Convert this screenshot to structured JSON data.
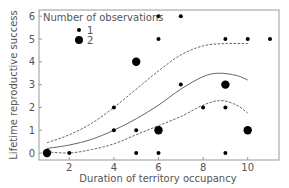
{
  "chart_data": {
    "type": "scatter",
    "title": "",
    "xlabel": "Duration of territory occupancy",
    "ylabel": "Lifetime reproductive success",
    "xlim": [
      0.6,
      11.4
    ],
    "ylim": [
      -0.3,
      6.3
    ],
    "xticks": [
      2,
      4,
      6,
      8,
      10
    ],
    "yticks": [
      0,
      1,
      2,
      3,
      4,
      5,
      6
    ],
    "grid": false,
    "legend": {
      "title": "Number of observations",
      "position": "upper left",
      "entries": [
        {
          "label": "1",
          "size": "small"
        },
        {
          "label": "2",
          "size": "large"
        }
      ]
    },
    "points": [
      {
        "x": 1,
        "y": 0,
        "n": 2
      },
      {
        "x": 2,
        "y": 0,
        "n": 1
      },
      {
        "x": 4,
        "y": 2,
        "n": 1
      },
      {
        "x": 4,
        "y": 1,
        "n": 1
      },
      {
        "x": 5,
        "y": 4,
        "n": 2
      },
      {
        "x": 5,
        "y": 1,
        "n": 1
      },
      {
        "x": 5,
        "y": 0,
        "n": 1
      },
      {
        "x": 6,
        "y": 6,
        "n": 1
      },
      {
        "x": 6,
        "y": 5,
        "n": 1
      },
      {
        "x": 6,
        "y": 1,
        "n": 2
      },
      {
        "x": 6,
        "y": 0,
        "n": 1
      },
      {
        "x": 7,
        "y": 6,
        "n": 1
      },
      {
        "x": 7,
        "y": 3,
        "n": 1
      },
      {
        "x": 8,
        "y": 2,
        "n": 1
      },
      {
        "x": 9,
        "y": 5,
        "n": 1
      },
      {
        "x": 9,
        "y": 3,
        "n": 2
      },
      {
        "x": 9,
        "y": 2,
        "n": 1
      },
      {
        "x": 9,
        "y": 0,
        "n": 1
      },
      {
        "x": 10,
        "y": 5,
        "n": 1
      },
      {
        "x": 10,
        "y": 1,
        "n": 2
      },
      {
        "x": 11,
        "y": 5,
        "n": 1
      }
    ],
    "series": [
      {
        "name": "fitted",
        "style": "solid",
        "x": [
          1,
          2,
          3,
          4,
          5,
          6,
          7,
          8,
          8.7,
          9.5,
          10
        ],
        "y": [
          0.2,
          0.35,
          0.6,
          1.0,
          1.5,
          2.1,
          2.8,
          3.35,
          3.5,
          3.4,
          3.2
        ]
      },
      {
        "name": "upper confidence limit",
        "style": "dashed",
        "x": [
          1,
          2,
          3,
          4,
          5,
          6,
          7,
          8,
          9,
          10
        ],
        "y": [
          0.45,
          0.8,
          1.3,
          2.0,
          2.8,
          3.6,
          4.3,
          4.7,
          4.8,
          4.8
        ]
      },
      {
        "name": "lower confidence limit",
        "style": "dashed",
        "x": [
          1,
          2,
          3,
          4,
          5,
          6,
          7,
          8,
          8.8,
          9.5,
          10
        ],
        "y": [
          0.05,
          0.0,
          0.15,
          0.4,
          0.8,
          1.2,
          1.6,
          2.1,
          2.3,
          2.1,
          1.75
        ]
      }
    ],
    "colors": {
      "points": "#000000",
      "lines": "#666666",
      "frame": "#999999",
      "text": "#555555"
    }
  }
}
